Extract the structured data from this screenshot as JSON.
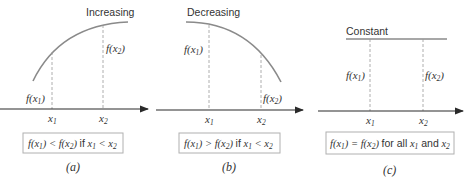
{
  "panels": [
    {
      "id": "a",
      "title": "Increasing",
      "f_x1_label": "f(x1)",
      "f_x2_label": "f(x2)",
      "x1_label": "x1",
      "x2_label": "x2",
      "condition": "f(x1) < f(x2) if x1 < x2",
      "caption": "(a)"
    },
    {
      "id": "b",
      "title": "Decreasing",
      "f_x1_label": "f(x1)",
      "f_x2_label": "f(x2)",
      "x1_label": "x1",
      "x2_label": "x2",
      "condition": "f(x1) > f(x2) if x1 < x2",
      "caption": "(b)"
    },
    {
      "id": "c",
      "title": "Constant",
      "f_x1_label": "f(x1)",
      "f_x2_label": "f(x2)",
      "x1_label": "x1",
      "x2_label": "x2",
      "condition": "f(x1) = f(x2) for all x1 and x2",
      "caption": "(c)"
    }
  ],
  "colors": {
    "curve": "#8a8a8a",
    "axis": "#2a2a2a",
    "dash": "#9a9a9a",
    "box_border": "#b0b0b0",
    "text": "#333333"
  }
}
